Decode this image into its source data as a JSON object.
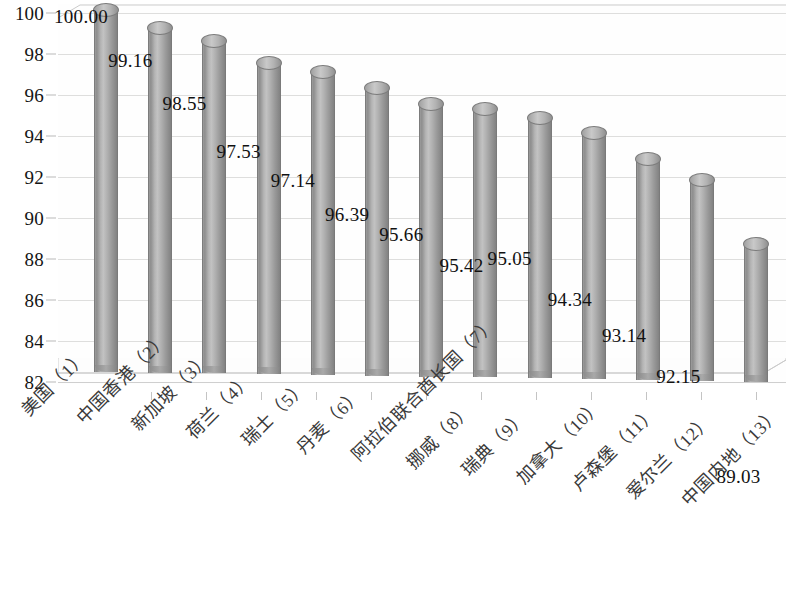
{
  "chart_data": {
    "type": "bar",
    "title": "",
    "subtitle": "",
    "xlabel": "",
    "ylabel": "",
    "ylim": [
      82,
      100
    ],
    "ytick_step": 2,
    "yticks": [
      100,
      98,
      96,
      94,
      92,
      90,
      88,
      86,
      84,
      82
    ],
    "grid": true,
    "legend": false,
    "legend_position": "none",
    "style": "3d-cylinder",
    "bar_color": "#a8a8a8",
    "categories": [
      "美国（1）",
      "中国香港（2）",
      "新加坡（3）",
      "荷兰（4）",
      "瑞士（5）",
      "丹麦（6）",
      "阿拉伯联合酋长国（7）",
      "挪威（8）",
      "瑞典（9）",
      "加拿大（10）",
      "卢森堡（11）",
      "爱尔兰（12）",
      "中国内地（13）"
    ],
    "values": [
      100.0,
      99.16,
      98.55,
      97.53,
      97.14,
      96.39,
      95.66,
      95.42,
      95.05,
      94.34,
      93.14,
      92.15,
      89.03
    ],
    "value_labels": [
      "100.00",
      "99.16",
      "98.55",
      "97.53",
      "97.14",
      "96.39",
      "95.66",
      "95.42",
      "95.05",
      "94.34",
      "93.14",
      "92.15",
      "89.03"
    ]
  }
}
